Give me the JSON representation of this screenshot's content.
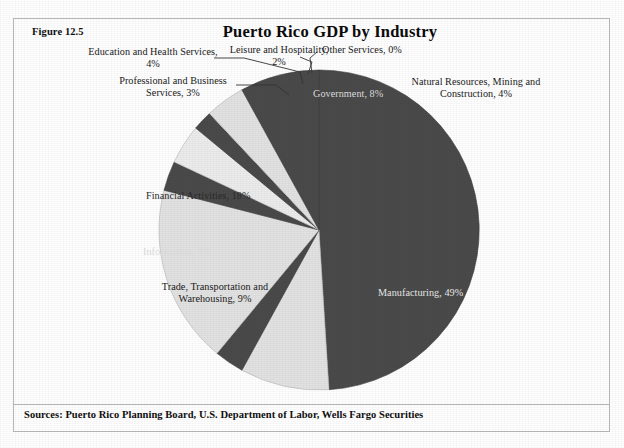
{
  "figure": {
    "number_label": "Figure 12.5",
    "top_bleed_text": " "
  },
  "title": "Puerto Rico GDP by Industry",
  "sources": "Sources: Puerto Rico Planning Board, U.S. Department of Labor, Wells Fargo Securities",
  "colors": {
    "dark_slice": "#4a4a4a",
    "light_slice": "#e2e2e2",
    "pale_slice": "#efefef",
    "frame": "#b9b9b9",
    "text": "#1a1a1a",
    "background": "#ffffff"
  },
  "labels": {
    "education_health": "Education and Health Services,\n4%",
    "leisure_hospitality": "Leisure and Hospitality,\n2%",
    "other_services": "Other Services, 0%",
    "natural_resources": "Natural Resources, Mining and\nConstruction, 4%",
    "professional_business": "Professional and Business\nServices, 3%",
    "government": "Government, 8%",
    "financial_activities": "Financial Activities, 18%",
    "information": "Information, 3%",
    "trade_transport": "Trade, Transportation and\nWarehousing, 9%",
    "manufacturing": "Manufacturing, 49%"
  },
  "chart_data": {
    "type": "pie",
    "title": "Puerto Rico GDP by Industry",
    "xlabel": "",
    "ylabel": "",
    "legend": "none (direct data labels)",
    "start_angle_deg": 0,
    "direction": "clockwise",
    "center": [
      319,
      230
    ],
    "radius": 160,
    "units": "percent of GDP",
    "categories": [
      "Manufacturing",
      "Trade, Transportation and Warehousing",
      "Information",
      "Financial Activities",
      "Professional and Business Services",
      "Education and Health Services",
      "Leisure and Hospitality",
      "Other Services",
      "Natural Resources, Mining and Construction",
      "Government"
    ],
    "values": [
      49,
      9,
      3,
      18,
      3,
      4,
      2,
      0,
      4,
      8
    ],
    "slice_colors": [
      "#4a4a4a",
      "#e2e2e2",
      "#4a4a4a",
      "#e2e2e2",
      "#4a4a4a",
      "#ececec",
      "#4a4a4a",
      "#d9d9d9",
      "#e2e2e2",
      "#4a4a4a"
    ],
    "data_labels": [
      "Manufacturing, 49%",
      "Trade, Transportation and Warehousing, 9%",
      "Information, 3%",
      "Financial Activities, 18%",
      "Professional and Business Services, 3%",
      "Education and Health Services, 4%",
      "Leisure and Hospitality, 2%",
      "Other Services, 0%",
      "Natural Resources, Mining and Construction, 4%",
      "Government, 8%"
    ],
    "total": 100
  }
}
